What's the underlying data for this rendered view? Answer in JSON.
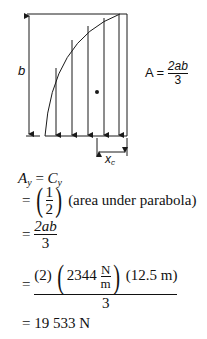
{
  "diagram": {
    "dimension_b_label": "b",
    "dimension_xc_label": "x",
    "dimension_xc_sub": "c",
    "area_formula": {
      "lhs": "A",
      "equals": "=",
      "numerator": "2ab",
      "denominator": "3"
    },
    "arrow_count": 5,
    "line_color": "#1a1a1a"
  },
  "equations": {
    "line1": {
      "lhs_var": "A",
      "lhs_sub": "y",
      "equals": "=",
      "rhs_var": "C",
      "rhs_sub": "y"
    },
    "line2": {
      "equals": "=",
      "frac_num": "1",
      "frac_den": "2",
      "text": "(area under parabola)"
    },
    "line3": {
      "equals": "=",
      "frac_num": "2ab",
      "frac_den": "3"
    },
    "line4": {
      "equals": "=",
      "num_part1": "(2)",
      "num_value": "2344",
      "unit_num": "N",
      "unit_den": "m",
      "num_part3": "(12.5 m)",
      "denominator": "3"
    },
    "line5": {
      "equals": "=",
      "result": "19 533 N"
    }
  }
}
